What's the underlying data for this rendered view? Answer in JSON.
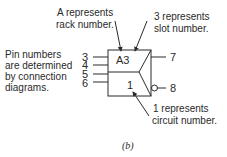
{
  "diagram": {
    "caption_prefix": "(",
    "caption_letter": "b",
    "caption_suffix": ")",
    "symbol": {
      "top_label": "A3",
      "bottom_label": "1",
      "input_pins": [
        "3",
        "4",
        "5",
        "6"
      ],
      "output_pins": [
        "7",
        "8"
      ],
      "inverted_output": "8"
    },
    "annotations": {
      "rack": [
        "A represents",
        "rack number."
      ],
      "slot": [
        "3 represents",
        "slot number."
      ],
      "circuit": [
        "1 represents",
        "circuit number."
      ],
      "pins": [
        "Pin numbers",
        "are determined",
        "by connection",
        "diagrams."
      ]
    },
    "colors": {
      "ink": "#2a2a2a",
      "background": "#ffffff"
    }
  }
}
